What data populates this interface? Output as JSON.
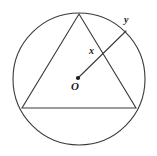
{
  "figure": {
    "background_color": "#ffffff",
    "stroke_color": "#3a3a3a",
    "label_color": "#1a1a1a",
    "labels": {
      "center": "O",
      "segment_inner": "x",
      "point_on_circle": "y"
    },
    "circle": {
      "center_x": 79,
      "center_y": 79,
      "radius": 66
    },
    "triangle": {
      "apex_x": 79,
      "apex_y": 14,
      "left_x": 22,
      "left_y": 108,
      "right_x": 136,
      "right_y": 108
    },
    "radius_segment": {
      "from_x": 78,
      "from_y": 78,
      "to_x": 126,
      "to_y": 31,
      "crossing_x": 103,
      "crossing_y": 55
    },
    "center_dot_radius": 2.1
  }
}
